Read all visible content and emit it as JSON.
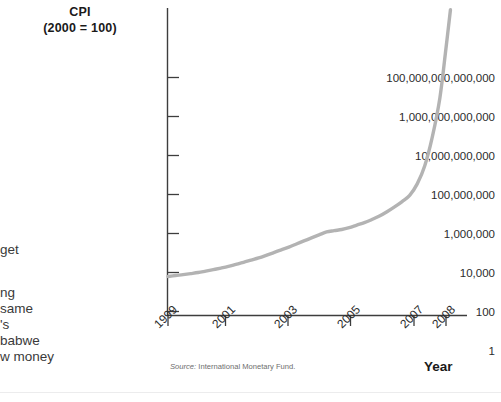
{
  "chart_data": {
    "type": "line",
    "title": "CPI",
    "subtitle": "(2000 = 100)",
    "xlabel": "Year",
    "ylabel": "CPI (2000 = 100)",
    "yscale": "log",
    "ylim": [
      1,
      1000000000000000
    ],
    "xlim": [
      1999,
      2008.6
    ],
    "grid": false,
    "legend": null,
    "source": "International Monetary Fund.",
    "source_prefix": "Source:",
    "ytick_labels": [
      "100,000,000,000,000",
      "1,000,000,000,000",
      "10,000,000,000",
      "100,000,000",
      "1,000,000",
      "10,000",
      "100",
      "1"
    ],
    "ytick_values": [
      100000000000000,
      1000000000000,
      10000000000,
      100000000,
      1000000,
      10000,
      100,
      1
    ],
    "xtick_labels": [
      "1999",
      "2001",
      "2003",
      "2005",
      "2007",
      "2008"
    ],
    "xtick_values": [
      1999,
      2001,
      2003,
      2005,
      2007,
      2008
    ],
    "series": [
      {
        "name": "Zimbabwe CPI",
        "color": "#b3b3b3",
        "x": [
          1999.0,
          1999.25,
          1999.5,
          1999.75,
          2000.0,
          2000.25,
          2000.5,
          2000.75,
          2001.0,
          2001.25,
          2001.5,
          2001.75,
          2002.0,
          2002.25,
          2002.5,
          2002.75,
          2003.0,
          2003.25,
          2003.5,
          2003.75,
          2004.0,
          2004.25,
          2004.5,
          2004.75,
          2005.0,
          2005.25,
          2005.5,
          2005.75,
          2006.0,
          2006.25,
          2006.5,
          2006.75,
          2007.0,
          2007.25,
          2007.5,
          2007.75,
          2008.0,
          2008.2,
          2008.35
        ],
        "y": [
          62,
          70,
          78,
          88,
          100,
          118,
          140,
          168,
          205,
          260,
          330,
          430,
          560,
          760,
          1050,
          1450,
          2000,
          2900,
          4200,
          6000,
          8500,
          12000,
          14000,
          16000,
          20000,
          27000,
          36000,
          52000,
          78000,
          130000,
          230000,
          430000,
          900000,
          3500000,
          30000000,
          900000000,
          90000000000,
          30000000000000,
          3000000000000000
        ]
      }
    ]
  },
  "page_text_fragments": [
    {
      "text": "get",
      "top": 242
    },
    {
      "text": "ng",
      "top": 285
    },
    {
      "text": "same",
      "top": 301
    },
    {
      "text": "'s",
      "top": 317
    },
    {
      "text": "babwe",
      "top": 333
    },
    {
      "text": "w money",
      "top": 349
    }
  ]
}
